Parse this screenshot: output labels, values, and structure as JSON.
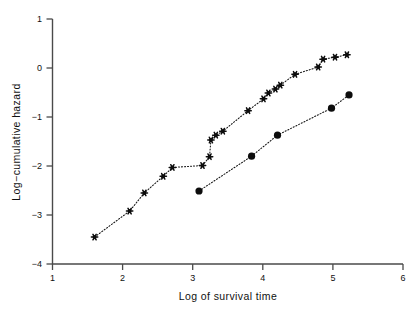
{
  "chart_data": {
    "type": "scatter",
    "title": "",
    "xlabel": "Log of survival time",
    "ylabel": "Log−cumulative hazard",
    "xlim": [
      1,
      6
    ],
    "ylim": [
      -4,
      1
    ],
    "xticks": [
      1,
      2,
      3,
      4,
      5,
      6
    ],
    "yticks": [
      -4,
      -3,
      -2,
      -1,
      0,
      1
    ],
    "xtick_labels": [
      "1",
      "2",
      "3",
      "4",
      "5",
      "6"
    ],
    "ytick_labels": [
      "−4",
      "−3",
      "−2",
      "−1",
      "0",
      "1"
    ],
    "grid": false,
    "legend": "none",
    "series": [
      {
        "name": "group-star",
        "marker": "star",
        "line": "dotted",
        "points": [
          [
            1.6,
            -3.45
          ],
          [
            2.1,
            -2.92
          ],
          [
            2.31,
            -2.55
          ],
          [
            2.58,
            -2.21
          ],
          [
            2.71,
            -2.03
          ],
          [
            3.14,
            -1.99
          ],
          [
            3.24,
            -1.81
          ],
          [
            3.26,
            -1.47
          ],
          [
            3.33,
            -1.37
          ],
          [
            3.43,
            -1.29
          ],
          [
            3.79,
            -0.87
          ],
          [
            4.01,
            -0.63
          ],
          [
            4.08,
            -0.51
          ],
          [
            4.18,
            -0.43
          ],
          [
            4.25,
            -0.35
          ],
          [
            4.46,
            -0.13
          ],
          [
            4.79,
            0.02
          ],
          [
            4.86,
            0.18
          ],
          [
            5.03,
            0.22
          ],
          [
            5.2,
            0.27
          ]
        ]
      },
      {
        "name": "group-circle",
        "marker": "circle",
        "line": "dotted",
        "points": [
          [
            3.09,
            -2.51
          ],
          [
            3.84,
            -1.8
          ],
          [
            4.21,
            -1.37
          ],
          [
            4.98,
            -0.82
          ],
          [
            5.23,
            -0.55
          ]
        ]
      }
    ]
  },
  "axes": {
    "x_title": "Log of survival time",
    "y_title": "Log−cumulative hazard"
  }
}
